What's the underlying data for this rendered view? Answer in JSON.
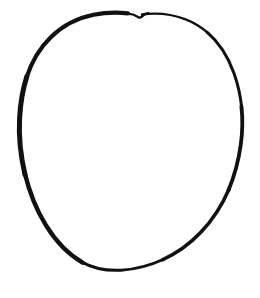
{
  "image": {
    "kind": "line-drawing",
    "subject": "hand-drawn oval outline",
    "description": "A single closed hand-drawn oval (ellipse) outline in black ink on a plain white background.",
    "width": 260,
    "height": 298,
    "background_color": "#ffffff",
    "stroke_color": "#111111",
    "caption": ""
  },
  "shape": {
    "name": "oval",
    "closed": true,
    "filled": false,
    "tilt_description": "slightly tilted, major axis running from upper-right toward lower-left",
    "bounds": {
      "left": 16,
      "top": 11,
      "right": 243,
      "bottom": 278
    },
    "center": {
      "x": 130,
      "y": 145
    },
    "radius_x": 113,
    "radius_y": 133,
    "stroke_width_min": 2.2,
    "stroke_width_max": 5.2,
    "notch": {
      "present": true,
      "label": "pen-closure notch at top",
      "x": 141,
      "y": 15
    },
    "outline_path": "M 141 13 C 120 11 96 16 76 29 C 52 44 33 70 23 101 C 14 129 15 160 24 190 C 33 219 50 243 71 259 C 92 275 116 280 139 275 C 163 270 186 255 203 234 C 221 212 233 185 239 156 C 245 128 244 100 236 76 C 228 52 213 33 194 23 C 178 15 160 12 145 14 L 141 16 L 137 13 Z",
    "stroke_segments": [
      {
        "name": "top-arc",
        "width": 2.4
      },
      {
        "name": "upper-left-arc",
        "width": 4.2
      },
      {
        "name": "left-arc",
        "width": 5.0
      },
      {
        "name": "lower-left-arc",
        "width": 4.4
      },
      {
        "name": "bottom-arc",
        "width": 3.0
      },
      {
        "name": "lower-right-arc",
        "width": 3.6
      },
      {
        "name": "right-arc",
        "width": 3.8
      },
      {
        "name": "upper-right-arc",
        "width": 3.0
      }
    ]
  }
}
